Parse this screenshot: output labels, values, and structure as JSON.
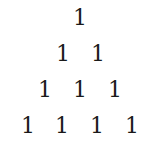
{
  "triangle": {
    "rows": [
      [
        "1"
      ],
      [
        "1",
        "1"
      ],
      [
        "1",
        "1",
        "1"
      ],
      [
        "1",
        "1",
        "1",
        "1"
      ]
    ]
  }
}
